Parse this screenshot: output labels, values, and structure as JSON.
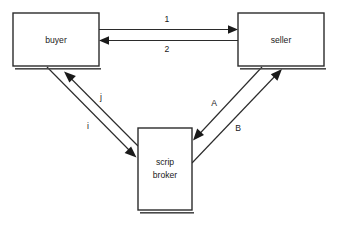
{
  "diagram": {
    "type": "node-edge-diagram",
    "background_color": "#ffffff",
    "line_color": "#2b2b2b",
    "text_color": "#1a1a1a",
    "nodes": [
      {
        "id": "buyer",
        "label": "buyer",
        "label_lines": [
          "buyer"
        ],
        "x": 13,
        "y": 13,
        "width": 86,
        "height": 53
      },
      {
        "id": "seller",
        "label": "seller",
        "label_lines": [
          "seller"
        ],
        "x": 238,
        "y": 13,
        "width": 86,
        "height": 53
      },
      {
        "id": "scrip-broker",
        "label": "scrip broker",
        "label_lines": [
          "scrip",
          "broker"
        ],
        "x": 138,
        "y": 128,
        "width": 54,
        "height": 82
      }
    ],
    "edges": [
      {
        "id": "edge-1",
        "label": "1",
        "from": "buyer",
        "to": "seller",
        "direction": "right"
      },
      {
        "id": "edge-2",
        "label": "2",
        "from": "seller",
        "to": "buyer",
        "direction": "left"
      },
      {
        "id": "edge-i",
        "label": "i",
        "from": "buyer",
        "to": "scrip-broker",
        "direction": "down-right"
      },
      {
        "id": "edge-j",
        "label": "j",
        "from": "scrip-broker",
        "to": "buyer",
        "direction": "up-left"
      },
      {
        "id": "edge-a",
        "label": "A",
        "from": "seller",
        "to": "scrip-broker",
        "direction": "down-left"
      },
      {
        "id": "edge-b",
        "label": "B",
        "from": "scrip-broker",
        "to": "seller",
        "direction": "up-right"
      }
    ]
  }
}
